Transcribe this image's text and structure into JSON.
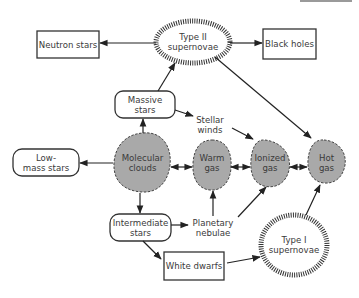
{
  "diagram": {
    "type": "flowchart",
    "colors": {
      "line": "#222222",
      "cloud_fill": "#a9a9a9",
      "cloud_border": "#444444",
      "text": "#3a3a3a",
      "background": "#ffffff"
    },
    "nodes": {
      "neutron_stars": {
        "label": "Neutron stars",
        "shape": "rectangle"
      },
      "type2_supernovae": {
        "label": "Type II\nsupernovae",
        "shape": "hatched-ellipse"
      },
      "black_holes": {
        "label": "Black holes",
        "shape": "rectangle"
      },
      "massive_stars": {
        "label": "Massive\nstars",
        "shape": "rounded-rectangle"
      },
      "stellar_winds": {
        "label": "Stellar\nwinds",
        "shape": "text"
      },
      "low_mass_stars": {
        "label": "Low-\nmass stars",
        "shape": "rounded-rectangle"
      },
      "molecular_clouds": {
        "label": "Molecular\nclouds",
        "shape": "cloud"
      },
      "warm_gas": {
        "label": "Warm\ngas",
        "shape": "cloud"
      },
      "ionized_gas": {
        "label": "Ionized\ngas",
        "shape": "cloud"
      },
      "hot_gas": {
        "label": "Hot\ngas",
        "shape": "cloud"
      },
      "intermediate_stars": {
        "label": "Intermediate\nstars",
        "shape": "rounded-rectangle"
      },
      "planetary_nebulae": {
        "label": "Planetary\nnebulae",
        "shape": "text"
      },
      "white_dwarfs": {
        "label": "White dwarfs",
        "shape": "rectangle"
      },
      "type1_supernovae": {
        "label": "Type I\nsupernovae",
        "shape": "hatched-circle"
      }
    },
    "edges": [
      {
        "from": "Type II supernovae",
        "to": "Neutron stars"
      },
      {
        "from": "Type II supernovae",
        "to": "Black holes"
      },
      {
        "from": "Type II supernovae",
        "to": "Hot gas"
      },
      {
        "from": "Massive stars",
        "to": "Type II supernovae"
      },
      {
        "from": "Massive stars",
        "to": "Stellar winds"
      },
      {
        "from": "Stellar winds",
        "to": "Ionized gas"
      },
      {
        "from": "Molecular clouds",
        "to": "Massive stars"
      },
      {
        "from": "Molecular clouds",
        "to": "Low-mass stars"
      },
      {
        "from": "Molecular clouds",
        "to": "Intermediate stars"
      },
      {
        "from": "Molecular clouds",
        "to": "Warm gas",
        "bidirectional": true
      },
      {
        "from": "Warm gas",
        "to": "Ionized gas",
        "bidirectional": true
      },
      {
        "from": "Ionized gas",
        "to": "Hot gas",
        "bidirectional": true
      },
      {
        "from": "Intermediate stars",
        "to": "Planetary nebulae"
      },
      {
        "from": "Planetary nebulae",
        "to": "Warm gas"
      },
      {
        "from": "Planetary nebulae",
        "to": "Ionized gas"
      },
      {
        "from": "Intermediate stars",
        "to": "White dwarfs"
      },
      {
        "from": "White dwarfs",
        "to": "Type I supernovae"
      },
      {
        "from": "Type I supernovae",
        "to": "Hot gas"
      }
    ]
  }
}
